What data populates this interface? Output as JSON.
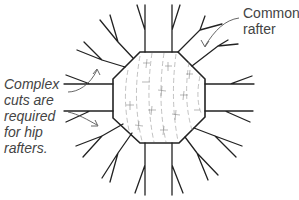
{
  "diagram": {
    "labels": {
      "common_rafter": [
        "Common",
        "rafter"
      ],
      "hip_note": [
        "Complex",
        "cuts are",
        "required",
        "for hip",
        "rafters."
      ]
    },
    "colors": {
      "line": "#222222",
      "text": "#444444",
      "grain": "#888888",
      "background": "#ffffff"
    },
    "octagon_vertices": [
      [
        140,
        52
      ],
      [
        178,
        52
      ],
      [
        205,
        79
      ],
      [
        205,
        117
      ],
      [
        179,
        143
      ],
      [
        140,
        143
      ],
      [
        113,
        118
      ],
      [
        113,
        79
      ]
    ]
  }
}
